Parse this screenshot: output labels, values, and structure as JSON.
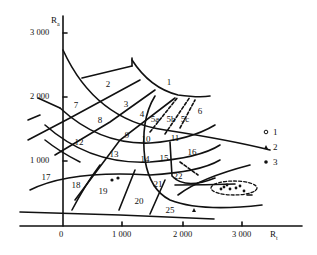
{
  "diagram": {
    "x_axis": {
      "title": "R",
      "title_sub": "t",
      "ticks": [
        "0",
        "1 000",
        "2 000",
        "3 000"
      ]
    },
    "y_axis": {
      "title": "R",
      "title_sub": "a",
      "ticks": [
        "3 000",
        "2 000",
        "1 000"
      ]
    },
    "regions": [
      "1",
      "2",
      "3",
      "4",
      "5a",
      "5b",
      "5c",
      "6",
      "7",
      "8",
      "9",
      "10",
      "11",
      "12",
      "13",
      "14",
      "15",
      "16",
      "17",
      "18",
      "19",
      "20",
      "21",
      "22",
      "25"
    ],
    "legend": [
      {
        "marker": "open-circle-dot",
        "label": "1"
      },
      {
        "marker": "triangle",
        "label": "2"
      },
      {
        "marker": "filled-dot",
        "label": "3"
      }
    ]
  }
}
